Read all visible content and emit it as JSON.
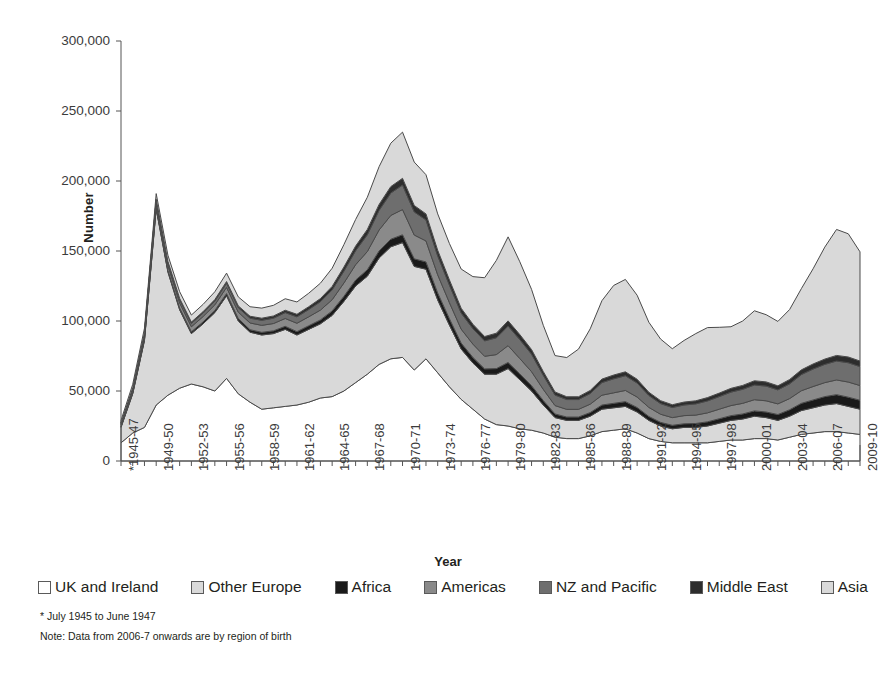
{
  "chart_data": {
    "type": "area",
    "stacked": true,
    "title": "",
    "xlabel": "Year",
    "ylabel": "Number",
    "ylim": [
      0,
      300000
    ],
    "yticks": [
      0,
      50000,
      100000,
      150000,
      200000,
      250000,
      300000
    ],
    "ytick_labels": [
      "0",
      "50,000",
      "100,000",
      "150,000",
      "200,000",
      "250,000",
      "300,000"
    ],
    "grid": false,
    "legend_position": "bottom",
    "x": [
      "*1945-47",
      "1947-48",
      "1948-49",
      "1949-50",
      "1950-51",
      "1951-52",
      "1952-53",
      "1953-54",
      "1954-55",
      "1955-56",
      "1956-57",
      "1957-58",
      "1958-59",
      "1959-60",
      "1960-61",
      "1961-62",
      "1962-63",
      "1963-64",
      "1964-65",
      "1965-66",
      "1966-67",
      "1967-68",
      "1968-69",
      "1969-70",
      "1970-71",
      "1971-72",
      "1972-73",
      "1973-74",
      "1974-75",
      "1975-76",
      "1976-77",
      "1977-78",
      "1978-79",
      "1979-80",
      "1980-81",
      "1981-82",
      "1982-83",
      "1983-84",
      "1984-85",
      "1985-86",
      "1986-87",
      "1987-88",
      "1988-89",
      "1989-90",
      "1990-91",
      "1991-92",
      "1992-93",
      "1993-94",
      "1994-95",
      "1995-96",
      "1996-97",
      "1997-98",
      "1998-99",
      "1999-00",
      "2000-01",
      "2001-02",
      "2002-03",
      "2003-04",
      "2004-05",
      "2005-06",
      "2006-07",
      "2007-08",
      "2008-09",
      "2009-10"
    ],
    "xtick_labels_shown": [
      "*1945-47",
      "1949-50",
      "1952-53",
      "1955-56",
      "1958-59",
      "1961-62",
      "1964-65",
      "1967-68",
      "1970-71",
      "1973-74",
      "1976-77",
      "1979-80",
      "1982-83",
      "1985-86",
      "1988-89",
      "1991-92",
      "1994-95",
      "1997-98",
      "2000-01",
      "2003-04",
      "2006-07",
      "2009-10"
    ],
    "series": [
      {
        "name": "UK and Ireland",
        "color": "#ffffff",
        "values": [
          13000,
          20000,
          24000,
          40000,
          47000,
          52000,
          55000,
          53000,
          50000,
          59000,
          48000,
          42000,
          37000,
          38000,
          39000,
          40000,
          42000,
          45000,
          46000,
          50000,
          56000,
          62000,
          69000,
          73000,
          74000,
          65000,
          73000,
          63000,
          53000,
          44000,
          37000,
          30000,
          26000,
          25000,
          23000,
          22000,
          20000,
          17000,
          16000,
          16000,
          18000,
          21000,
          22000,
          23000,
          20000,
          16000,
          14000,
          13000,
          13000,
          13000,
          13000,
          14000,
          15000,
          15000,
          16000,
          16000,
          15000,
          17000,
          19000,
          20000,
          21000,
          21000,
          20000,
          19000
        ]
      },
      {
        "name": "Other Europe",
        "color": "#d9d9d9",
        "values": [
          11000,
          28000,
          62000,
          140000,
          88000,
          56000,
          36000,
          45000,
          56000,
          59000,
          52000,
          50000,
          53000,
          53000,
          55000,
          50000,
          52000,
          53000,
          58000,
          64000,
          69000,
          70000,
          76000,
          80000,
          82000,
          74000,
          64000,
          52000,
          44000,
          36000,
          33000,
          32000,
          36000,
          41000,
          35000,
          28000,
          20000,
          14000,
          13000,
          13000,
          14000,
          16000,
          16000,
          16000,
          15000,
          13000,
          11000,
          10000,
          11000,
          11000,
          12000,
          13000,
          14000,
          15000,
          16000,
          15000,
          14000,
          15000,
          17000,
          18000,
          19000,
          20000,
          19000,
          18000
        ]
      },
      {
        "name": "Africa",
        "color": "#1a1a1a",
        "values": [
          500,
          700,
          900,
          1100,
          1200,
          1300,
          1300,
          1400,
          1500,
          1600,
          1700,
          1800,
          1900,
          2000,
          2200,
          2400,
          2600,
          2800,
          3200,
          3600,
          4200,
          4600,
          5000,
          5400,
          5600,
          5400,
          5200,
          5000,
          4600,
          4200,
          4000,
          3800,
          4000,
          4400,
          4200,
          3800,
          3200,
          2600,
          2400,
          2400,
          2600,
          3000,
          3200,
          3400,
          3200,
          2800,
          2600,
          2500,
          2600,
          2800,
          3000,
          3200,
          3400,
          3600,
          3800,
          4000,
          4200,
          4600,
          5200,
          5600,
          6000,
          6400,
          6600,
          6400
        ]
      },
      {
        "name": "Americas",
        "color": "#8a8a8a",
        "values": [
          1500,
          2000,
          2600,
          3200,
          3400,
          3600,
          3600,
          3800,
          4000,
          4400,
          4600,
          4800,
          5000,
          5200,
          5600,
          6000,
          6400,
          7000,
          8000,
          9500,
          11000,
          13000,
          15000,
          17000,
          18000,
          17000,
          15000,
          13000,
          11500,
          10000,
          9500,
          9000,
          10000,
          12000,
          11000,
          10000,
          8000,
          6000,
          5500,
          5500,
          6000,
          7000,
          7500,
          8000,
          7500,
          6500,
          5800,
          5500,
          5800,
          6000,
          6400,
          6800,
          7200,
          7600,
          8000,
          8000,
          7600,
          8000,
          9000,
          9600,
          10000,
          10500,
          10800,
          10500
        ]
      },
      {
        "name": "NZ and Pacific",
        "color": "#6e6e6e",
        "values": [
          800,
          1100,
          1500,
          1900,
          2100,
          2300,
          2400,
          2500,
          2700,
          3000,
          3200,
          3400,
          3600,
          3800,
          4200,
          4600,
          5200,
          6000,
          7000,
          8500,
          10000,
          12000,
          14000,
          16000,
          17500,
          16500,
          15000,
          13500,
          12500,
          11500,
          11000,
          11000,
          12000,
          14000,
          13500,
          12500,
          10000,
          7500,
          7000,
          7000,
          7600,
          9000,
          10000,
          10500,
          10000,
          8500,
          7600,
          7200,
          7600,
          8000,
          8500,
          9000,
          9600,
          10000,
          10500,
          10500,
          10000,
          10500,
          11500,
          12500,
          13000,
          13500,
          13800,
          13500
        ]
      },
      {
        "name": "Middle East",
        "color": "#2d2d2d",
        "values": [
          400,
          500,
          600,
          800,
          900,
          950,
          950,
          1000,
          1100,
          1200,
          1300,
          1400,
          1500,
          1600,
          1700,
          1800,
          2000,
          2200,
          2500,
          2900,
          3300,
          3800,
          4200,
          4600,
          4800,
          4600,
          4300,
          4000,
          3700,
          3400,
          3200,
          3100,
          3300,
          3700,
          3600,
          3300,
          2700,
          2200,
          2000,
          2000,
          2200,
          2500,
          2700,
          2800,
          2700,
          2300,
          2100,
          2000,
          2100,
          2200,
          2400,
          2500,
          2700,
          2800,
          3000,
          3000,
          2900,
          3100,
          3400,
          3600,
          3800,
          4000,
          4100,
          4000
        ]
      },
      {
        "name": "Asia",
        "color": "#d9d9d9",
        "values": [
          1800,
          2500,
          3200,
          4000,
          4400,
          4800,
          5000,
          5200,
          5600,
          6000,
          6400,
          6800,
          7200,
          7600,
          8200,
          8800,
          9600,
          11000,
          13000,
          16000,
          19000,
          23000,
          27000,
          31000,
          33000,
          31000,
          28000,
          26000,
          26000,
          28000,
          34000,
          42000,
          52000,
          60000,
          52000,
          43000,
          33000,
          26000,
          28000,
          34000,
          44000,
          56000,
          64000,
          66000,
          60000,
          50000,
          44000,
          40000,
          44000,
          48000,
          50000,
          47000,
          44000,
          46000,
          50000,
          48000,
          46000,
          50000,
          58000,
          68000,
          80000,
          90000,
          88000,
          78000
        ]
      }
    ],
    "footnotes": [
      "* July 1945 to June 1947",
      "Note: Data from 2006-7 onwards are by region of birth"
    ]
  }
}
